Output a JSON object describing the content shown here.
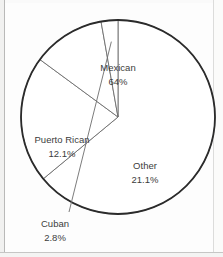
{
  "chart_data": {
    "type": "pie",
    "title": "",
    "subtitle": "",
    "xlabel": "",
    "ylabel": "",
    "legend_position": "none",
    "grid": false,
    "labels_inline": true,
    "categories": [
      "Mexican",
      "Other",
      "Puerto Rican",
      "Cuban"
    ],
    "values": [
      64,
      21.1,
      12.1,
      2.8
    ],
    "value_strings": [
      "64%",
      "21.1%",
      "12.1%",
      "2.8%"
    ],
    "slices": [
      {
        "label": "Mexican",
        "value": 64,
        "value_text": "64%",
        "label_x": 118,
        "label_y": 68,
        "value_x": 118,
        "value_y": 82,
        "leader": false
      },
      {
        "label": "Other",
        "value": 21.1,
        "value_text": "21.1%",
        "label_x": 145,
        "label_y": 166,
        "value_x": 145,
        "value_y": 180,
        "leader": false
      },
      {
        "label": "Puerto Rican",
        "value": 12.1,
        "value_text": "12.1%",
        "label_x": 62,
        "label_y": 140,
        "value_x": 62,
        "value_y": 154,
        "leader": false
      },
      {
        "label": "Cuban",
        "value": 2.8,
        "value_text": "2.8%",
        "label_x": 55,
        "label_y": 224,
        "value_x": 55,
        "value_y": 238,
        "leader": true
      }
    ],
    "geometry": {
      "center_x": 118,
      "center_y": 117,
      "radius": 97,
      "start_angle_deg": 0,
      "direction": "clockwise"
    },
    "colors": {
      "slice_fill": "#ffffff",
      "outline": "#2b2b2b",
      "divider": "#6d6d6d",
      "text": "#3c3c3c",
      "background": "#fdfdfd"
    }
  }
}
